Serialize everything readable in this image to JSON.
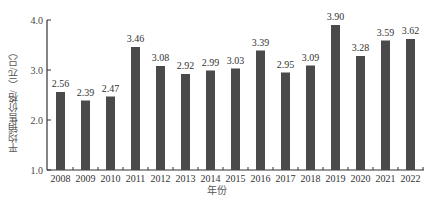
{
  "chart_data": {
    "type": "bar",
    "title": "",
    "xlabel": "年份",
    "ylabel": "平均销售价格/（元/只）",
    "categories": [
      "2008",
      "2009",
      "2010",
      "2011",
      "2012",
      "2013",
      "2014",
      "2015",
      "2016",
      "2017",
      "2018",
      "2019",
      "2020",
      "2021",
      "2022"
    ],
    "values": [
      2.56,
      2.39,
      2.47,
      3.46,
      3.08,
      2.92,
      2.99,
      3.03,
      3.39,
      2.95,
      3.09,
      3.9,
      3.28,
      3.59,
      3.62
    ],
    "value_labels": [
      "2.56",
      "2.39",
      "2.47",
      "3.46",
      "3.08",
      "2.92",
      "2.99",
      "3.03",
      "3.39",
      "2.95",
      "3.09",
      "3.90",
      "3.28",
      "3.59",
      "3.62"
    ],
    "yticks": [
      "1.0",
      "2.0",
      "3.0",
      "4.0"
    ],
    "ylim": [
      1.0,
      4.0
    ],
    "grid": false,
    "legend": null,
    "bar_color": "#4a4a4a"
  },
  "caption": ""
}
